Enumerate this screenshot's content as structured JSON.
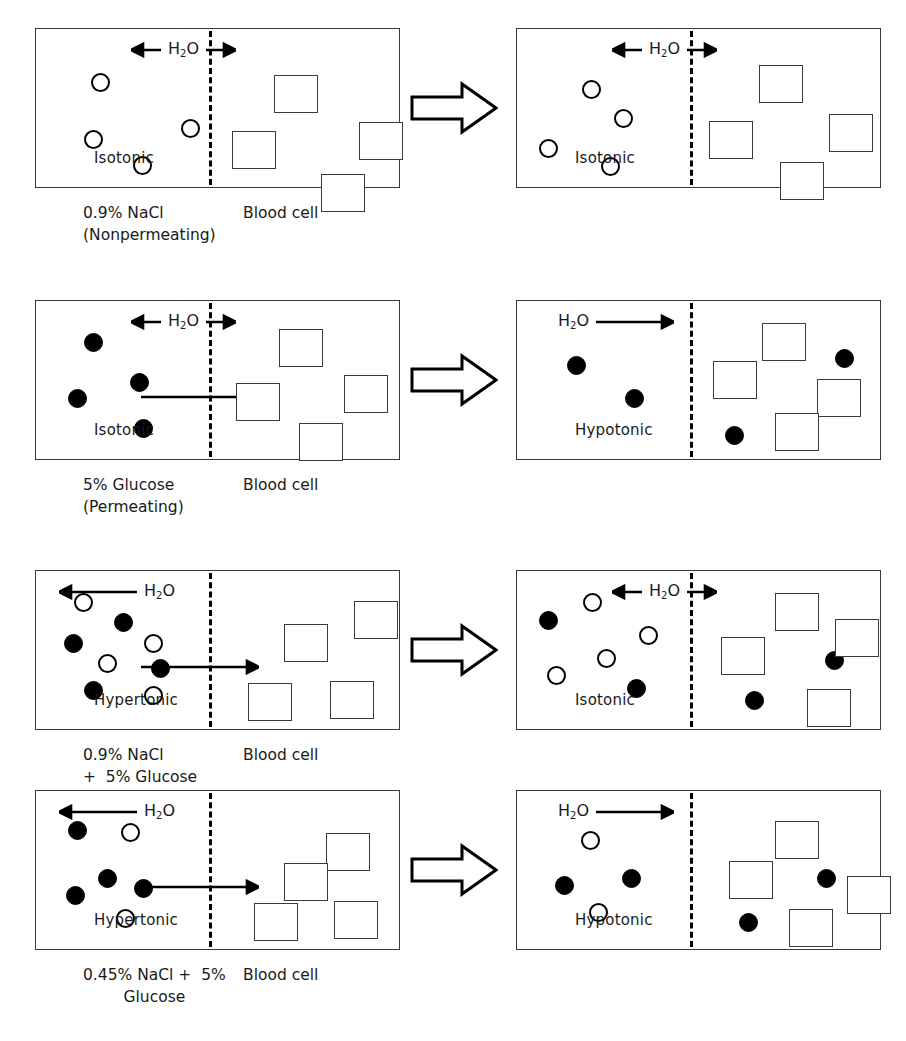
{
  "figure": {
    "legend": {
      "open_circle": "nonpermeating solute particle (NaCl)",
      "filled_circle": "permeating solute particle (glucose)",
      "square": "blood cell",
      "dashed_line": "cell membrane"
    },
    "water_label": "H",
    "water_sub": "2",
    "water_label_end": "O",
    "blood_cell_label": "Blood cell",
    "transition_icon": "block-right-arrow"
  },
  "rows": [
    {
      "id": "row-1",
      "solution_caption": "0.9% NaCl\n(Nonpermeating)",
      "solution_caption_line1": "0.9% NaCl",
      "solution_caption_line2": "(Nonpermeating)",
      "cell_caption": "Blood cell",
      "before": {
        "tonicity": "Isotonic",
        "water_direction": "both",
        "solute_arrow": false,
        "solution_particles": [
          {
            "type": "open",
            "x": 55,
            "y": 44
          },
          {
            "type": "open",
            "x": 145,
            "y": 90
          },
          {
            "type": "open",
            "x": 48,
            "y": 101
          },
          {
            "type": "open",
            "x": 97,
            "y": 127
          }
        ],
        "cell_particles": [],
        "cells": [
          {
            "x": 238,
            "y": 46
          },
          {
            "x": 196,
            "y": 102
          },
          {
            "x": 285,
            "y": 145
          },
          {
            "x": 323,
            "y": 93
          }
        ]
      },
      "after": {
        "tonicity": "Isotonic",
        "water_direction": "both",
        "solute_arrow": false,
        "solution_particles": [
          {
            "type": "open",
            "x": 65,
            "y": 51
          },
          {
            "type": "open",
            "x": 97,
            "y": 80
          },
          {
            "type": "open",
            "x": 22,
            "y": 110
          },
          {
            "type": "open",
            "x": 84,
            "y": 128
          }
        ],
        "cell_particles": [],
        "cells": [
          {
            "x": 242,
            "y": 36
          },
          {
            "x": 192,
            "y": 92
          },
          {
            "x": 263,
            "y": 133
          },
          {
            "x": 312,
            "y": 85
          }
        ]
      }
    },
    {
      "id": "row-2",
      "solution_caption_line1": "5% Glucose",
      "solution_caption_line2": "(Permeating)",
      "cell_caption": "Blood cell",
      "before": {
        "tonicity": "Isotonic",
        "water_direction": "both",
        "solute_arrow": true,
        "solution_particles": [
          {
            "type": "filled",
            "x": 48,
            "y": 32
          },
          {
            "type": "filled",
            "x": 94,
            "y": 72
          },
          {
            "type": "filled",
            "x": 32,
            "y": 88
          },
          {
            "type": "filled",
            "x": 98,
            "y": 118
          }
        ],
        "cell_particles": [],
        "cells": [
          {
            "x": 243,
            "y": 28
          },
          {
            "x": 200,
            "y": 82
          },
          {
            "x": 263,
            "y": 122
          },
          {
            "x": 308,
            "y": 74
          }
        ]
      },
      "after": {
        "tonicity": "Hypotonic",
        "water_direction": "right",
        "solute_arrow": false,
        "solution_particles": [
          {
            "type": "filled",
            "x": 50,
            "y": 55
          },
          {
            "type": "filled",
            "x": 108,
            "y": 88
          }
        ],
        "cell_particles": [
          {
            "type": "filled",
            "x": 208,
            "y": 125
          },
          {
            "type": "filled",
            "x": 318,
            "y": 48
          }
        ],
        "cells": [
          {
            "x": 245,
            "y": 22
          },
          {
            "x": 196,
            "y": 60
          },
          {
            "x": 300,
            "y": 78
          },
          {
            "x": 258,
            "y": 112
          }
        ]
      }
    },
    {
      "id": "row-3",
      "solution_caption_line1": "0.9% NaCl",
      "solution_caption_line2": "+  5% Glucose",
      "cell_caption": "Blood cell",
      "before": {
        "tonicity": "Hypertonic",
        "water_direction": "left",
        "solute_arrow": true,
        "solution_particles": [
          {
            "type": "open",
            "x": 38,
            "y": 22
          },
          {
            "type": "filled",
            "x": 78,
            "y": 42
          },
          {
            "type": "filled",
            "x": 28,
            "y": 63
          },
          {
            "type": "open",
            "x": 108,
            "y": 63
          },
          {
            "type": "open",
            "x": 62,
            "y": 83
          },
          {
            "type": "filled",
            "x": 115,
            "y": 88
          },
          {
            "type": "filled",
            "x": 48,
            "y": 110
          },
          {
            "type": "open",
            "x": 108,
            "y": 115
          }
        ],
        "cell_particles": [],
        "cells": [
          {
            "x": 248,
            "y": 53
          },
          {
            "x": 318,
            "y": 30
          },
          {
            "x": 212,
            "y": 112
          },
          {
            "x": 294,
            "y": 110
          }
        ]
      },
      "after": {
        "tonicity": "Isotonic",
        "water_direction": "both",
        "solute_arrow": false,
        "solution_particles": [
          {
            "type": "filled",
            "x": 22,
            "y": 40
          },
          {
            "type": "open",
            "x": 66,
            "y": 22
          },
          {
            "type": "open",
            "x": 122,
            "y": 55
          },
          {
            "type": "open",
            "x": 80,
            "y": 78
          },
          {
            "type": "open",
            "x": 30,
            "y": 95
          },
          {
            "type": "filled",
            "x": 110,
            "y": 108
          }
        ],
        "cell_particles": [
          {
            "type": "filled",
            "x": 228,
            "y": 120
          },
          {
            "type": "filled",
            "x": 308,
            "y": 80
          }
        ],
        "cells": [
          {
            "x": 258,
            "y": 22
          },
          {
            "x": 318,
            "y": 48
          },
          {
            "x": 204,
            "y": 66
          },
          {
            "x": 290,
            "y": 118
          }
        ]
      }
    },
    {
      "id": "row-4",
      "solution_caption_line1": "0.45% NaCl +  5%",
      "solution_caption_line2": "Glucose",
      "cell_caption": "Blood cell",
      "before": {
        "tonicity": "Hypertonic",
        "water_direction": "left",
        "solute_arrow": true,
        "solution_particles": [
          {
            "type": "filled",
            "x": 32,
            "y": 30
          },
          {
            "type": "open",
            "x": 85,
            "y": 32
          },
          {
            "type": "filled",
            "x": 62,
            "y": 78
          },
          {
            "type": "filled",
            "x": 30,
            "y": 95
          },
          {
            "type": "filled",
            "x": 98,
            "y": 88
          },
          {
            "type": "open",
            "x": 80,
            "y": 118
          }
        ],
        "cell_particles": [],
        "cells": [
          {
            "x": 290,
            "y": 42
          },
          {
            "x": 248,
            "y": 72
          },
          {
            "x": 218,
            "y": 112
          },
          {
            "x": 298,
            "y": 110
          }
        ]
      },
      "after": {
        "tonicity": "Hypotonic",
        "water_direction": "right",
        "solute_arrow": false,
        "solution_particles": [
          {
            "type": "open",
            "x": 64,
            "y": 40
          },
          {
            "type": "filled",
            "x": 38,
            "y": 85
          },
          {
            "type": "filled",
            "x": 105,
            "y": 78
          },
          {
            "type": "open",
            "x": 72,
            "y": 112
          }
        ],
        "cell_particles": [
          {
            "type": "filled",
            "x": 300,
            "y": 78
          },
          {
            "type": "filled",
            "x": 222,
            "y": 122
          }
        ],
        "cells": [
          {
            "x": 258,
            "y": 30
          },
          {
            "x": 212,
            "y": 70
          },
          {
            "x": 330,
            "y": 85
          },
          {
            "x": 272,
            "y": 118
          }
        ]
      }
    }
  ]
}
